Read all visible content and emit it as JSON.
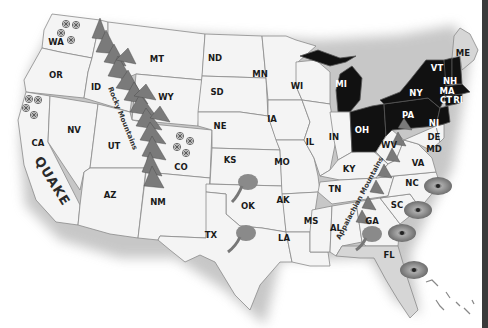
{
  "map": {
    "title": "United States natural hazards map",
    "colors": {
      "land": "#f4f4f4",
      "highlight_states": "#111111",
      "border": "#8a8a8a",
      "shadow": "#cfcfcf"
    },
    "states": [
      {
        "abbr": "WA"
      },
      {
        "abbr": "OR"
      },
      {
        "abbr": "CA"
      },
      {
        "abbr": "NV"
      },
      {
        "abbr": "ID"
      },
      {
        "abbr": "MT"
      },
      {
        "abbr": "WY"
      },
      {
        "abbr": "UT"
      },
      {
        "abbr": "AZ"
      },
      {
        "abbr": "CO"
      },
      {
        "abbr": "NM"
      },
      {
        "abbr": "ND"
      },
      {
        "abbr": "SD"
      },
      {
        "abbr": "NE"
      },
      {
        "abbr": "KS"
      },
      {
        "abbr": "OK"
      },
      {
        "abbr": "TX"
      },
      {
        "abbr": "MN"
      },
      {
        "abbr": "IA"
      },
      {
        "abbr": "MO"
      },
      {
        "abbr": "AK"
      },
      {
        "abbr": "LA"
      },
      {
        "abbr": "WI"
      },
      {
        "abbr": "IL"
      },
      {
        "abbr": "MS"
      },
      {
        "abbr": "MI"
      },
      {
        "abbr": "IN"
      },
      {
        "abbr": "KY"
      },
      {
        "abbr": "TN"
      },
      {
        "abbr": "AL"
      },
      {
        "abbr": "OH"
      },
      {
        "abbr": "WV"
      },
      {
        "abbr": "GA"
      },
      {
        "abbr": "FL"
      },
      {
        "abbr": "SC"
      },
      {
        "abbr": "NC"
      },
      {
        "abbr": "VA"
      },
      {
        "abbr": "PA"
      },
      {
        "abbr": "NY"
      },
      {
        "abbr": "MD"
      },
      {
        "abbr": "DE"
      },
      {
        "abbr": "NJ"
      },
      {
        "abbr": "CT"
      },
      {
        "abbr": "RI"
      },
      {
        "abbr": "MA"
      },
      {
        "abbr": "VT"
      },
      {
        "abbr": "NH"
      },
      {
        "abbr": "ME"
      }
    ],
    "highlighted_states": [
      "MI",
      "OH",
      "PA",
      "NY",
      "NJ",
      "VT",
      "NH",
      "MA",
      "CT",
      "RI"
    ],
    "annotations": {
      "rocky": "Rocky Mountains",
      "appalachian": "Appalachian Mountains",
      "quake": "QUAKE"
    },
    "hazard_icons": {
      "snowflakes": [
        "WA",
        "CA",
        "CO"
      ],
      "tornadoes": [
        "OK",
        "TX",
        "GA"
      ],
      "hurricanes": [
        "NC",
        "SC",
        "GA",
        "FL"
      ]
    }
  }
}
